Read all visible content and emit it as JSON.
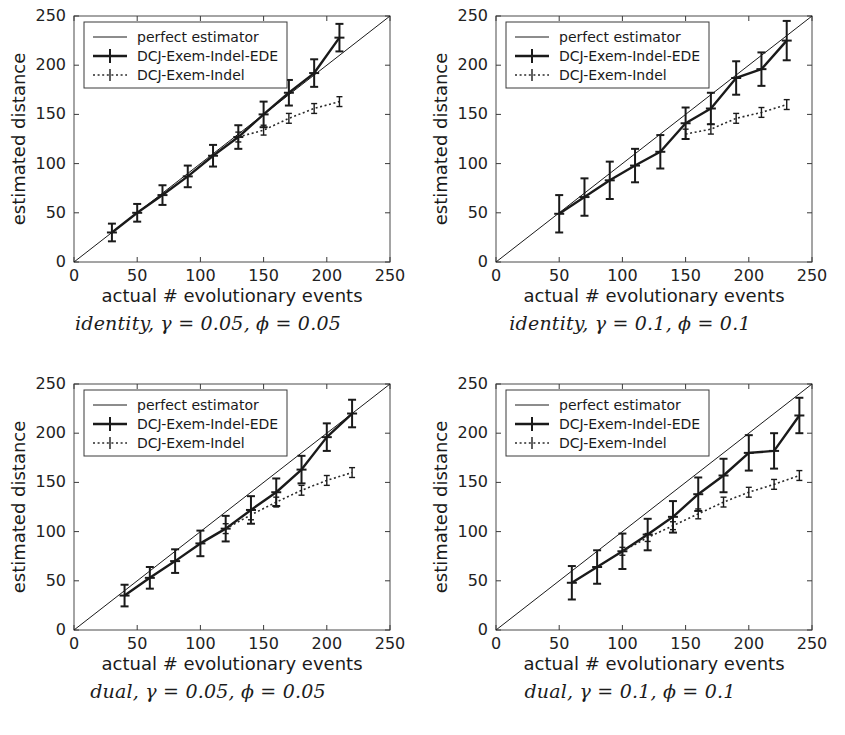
{
  "figure": {
    "panel_count": 4,
    "background": "#ffffff",
    "line_color": "#1a1a1a"
  },
  "axes": {
    "xlabel": "actual # evolutionary events",
    "ylabel": "estimated distance",
    "xticks": [
      0,
      50,
      100,
      150,
      200,
      250
    ],
    "yticks": [
      0,
      50,
      100,
      150,
      200,
      250
    ],
    "xlim": [
      0,
      250
    ],
    "ylim": [
      0,
      250
    ],
    "grid": false
  },
  "legend": {
    "position": "upper-left",
    "entries": [
      {
        "label": "perfect estimator",
        "style": "thin-solid"
      },
      {
        "label": "DCJ-Exem-Indel-EDE",
        "style": "thick-solid-errorbar"
      },
      {
        "label": "DCJ-Exem-Indel",
        "style": "dotted-errorbar"
      }
    ]
  },
  "captions": [
    {
      "name": "identity",
      "gamma": "0.05",
      "phi": "0.05",
      "text": "identity, γ = 0.05, ϕ = 0.05"
    },
    {
      "name": "identity",
      "gamma": "0.1",
      "phi": "0.1",
      "text": "identity, γ = 0.1, ϕ = 0.1"
    },
    {
      "name": "dual",
      "gamma": "0.05",
      "phi": "0.05",
      "text": "dual, γ = 0.05, ϕ = 0.05"
    },
    {
      "name": "dual",
      "gamma": "0.1",
      "phi": "0.1",
      "text": "dual, γ = 0.1, ϕ = 0.1"
    }
  ],
  "chart_data": [
    {
      "type": "line",
      "title": "identity, gamma = 0.05, phi = 0.05",
      "xlabel": "actual # evolutionary events",
      "ylabel": "estimated distance",
      "xlim": [
        0,
        250
      ],
      "ylim": [
        0,
        250
      ],
      "xticks": [
        0,
        50,
        100,
        150,
        200,
        250
      ],
      "yticks": [
        0,
        50,
        100,
        150,
        200,
        250
      ],
      "grid": false,
      "series": [
        {
          "name": "perfect estimator",
          "style": "thin-solid",
          "x": [
            0,
            250
          ],
          "values": [
            0,
            250
          ]
        },
        {
          "name": "DCJ-Exem-Indel-EDE",
          "style": "thick-solid-errorbar",
          "x": [
            30,
            50,
            70,
            90,
            110,
            130,
            150,
            170,
            190,
            210
          ],
          "values": [
            30,
            50,
            68,
            87,
            108,
            127,
            150,
            172,
            192,
            228
          ],
          "errors": [
            9,
            9,
            10,
            11,
            11,
            12,
            13,
            13,
            14,
            14
          ]
        },
        {
          "name": "DCJ-Exem-Indel",
          "style": "dotted-errorbar",
          "x": [
            130,
            150,
            170,
            190,
            210
          ],
          "values": [
            127,
            134,
            146,
            156,
            163
          ],
          "errors": [
            5,
            5,
            5,
            5,
            5
          ]
        }
      ]
    },
    {
      "type": "line",
      "title": "identity, gamma = 0.1, phi = 0.1",
      "xlabel": "actual # evolutionary events",
      "ylabel": "estimated distance",
      "xlim": [
        0,
        250
      ],
      "ylim": [
        0,
        250
      ],
      "xticks": [
        0,
        50,
        100,
        150,
        200,
        250
      ],
      "yticks": [
        0,
        50,
        100,
        150,
        200,
        250
      ],
      "grid": false,
      "series": [
        {
          "name": "perfect estimator",
          "style": "thin-solid",
          "x": [
            0,
            250
          ],
          "values": [
            0,
            250
          ]
        },
        {
          "name": "DCJ-Exem-Indel-EDE",
          "style": "thick-solid-errorbar",
          "x": [
            50,
            70,
            90,
            110,
            130,
            150,
            170,
            190,
            210,
            230
          ],
          "values": [
            49,
            66,
            83,
            98,
            112,
            141,
            156,
            187,
            196,
            225
          ],
          "errors": [
            19,
            19,
            19,
            17,
            17,
            16,
            16,
            17,
            17,
            20
          ]
        },
        {
          "name": "DCJ-Exem-Indel",
          "style": "dotted-errorbar",
          "x": [
            150,
            170,
            190,
            210,
            230
          ],
          "values": [
            130,
            135,
            146,
            152,
            160
          ],
          "errors": [
            5,
            5,
            5,
            5,
            5
          ]
        }
      ]
    },
    {
      "type": "line",
      "title": "dual, gamma = 0.05, phi = 0.05",
      "xlabel": "actual # evolutionary events",
      "ylabel": "estimated distance",
      "xlim": [
        0,
        250
      ],
      "ylim": [
        0,
        250
      ],
      "xticks": [
        0,
        50,
        100,
        150,
        200,
        250
      ],
      "yticks": [
        0,
        50,
        100,
        150,
        200,
        250
      ],
      "grid": false,
      "series": [
        {
          "name": "perfect estimator",
          "style": "thin-solid",
          "x": [
            0,
            250
          ],
          "values": [
            0,
            250
          ]
        },
        {
          "name": "DCJ-Exem-Indel-EDE",
          "style": "thick-solid-errorbar",
          "x": [
            40,
            60,
            80,
            100,
            120,
            140,
            160,
            180,
            200,
            220
          ],
          "values": [
            35,
            53,
            70,
            88,
            103,
            122,
            140,
            163,
            196,
            220
          ],
          "errors": [
            11,
            11,
            12,
            13,
            13,
            14,
            14,
            14,
            14,
            14
          ]
        },
        {
          "name": "DCJ-Exem-Indel",
          "style": "dotted-errorbar",
          "x": [
            120,
            140,
            160,
            180,
            200,
            220
          ],
          "values": [
            103,
            117,
            130,
            142,
            152,
            160
          ],
          "errors": [
            5,
            5,
            5,
            5,
            5,
            5
          ]
        }
      ]
    },
    {
      "type": "line",
      "title": "dual, gamma = 0.1, phi = 0.1",
      "xlabel": "actual # evolutionary events",
      "ylabel": "estimated distance",
      "xlim": [
        0,
        250
      ],
      "ylim": [
        0,
        250
      ],
      "xticks": [
        0,
        50,
        100,
        150,
        200,
        250
      ],
      "yticks": [
        0,
        50,
        100,
        150,
        200,
        250
      ],
      "grid": false,
      "series": [
        {
          "name": "perfect estimator",
          "style": "thin-solid",
          "x": [
            0,
            250
          ],
          "values": [
            0,
            250
          ]
        },
        {
          "name": "DCJ-Exem-Indel-EDE",
          "style": "thick-solid-errorbar",
          "x": [
            60,
            80,
            100,
            120,
            140,
            160,
            180,
            200,
            220,
            240
          ],
          "values": [
            48,
            64,
            80,
            97,
            115,
            138,
            157,
            180,
            182,
            218
          ],
          "errors": [
            17,
            17,
            18,
            16,
            16,
            17,
            17,
            18,
            18,
            18
          ]
        },
        {
          "name": "DCJ-Exem-Indel",
          "style": "dotted-errorbar",
          "x": [
            100,
            120,
            140,
            160,
            180,
            200,
            220,
            240
          ],
          "values": [
            80,
            94,
            106,
            118,
            130,
            140,
            148,
            157
          ],
          "errors": [
            4,
            4,
            4,
            5,
            5,
            5,
            5,
            5
          ]
        }
      ]
    }
  ]
}
